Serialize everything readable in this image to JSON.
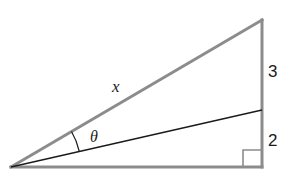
{
  "diagram": {
    "type": "right-triangle",
    "labels": {
      "hypotenuse": "x",
      "angle": "θ",
      "upper_segment": "3",
      "lower_segment": "2"
    },
    "vertices": {
      "left": [
        11,
        167
      ],
      "top_right": [
        262,
        20
      ],
      "bottom_right": [
        262,
        167
      ],
      "split_point": [
        262,
        110
      ]
    },
    "right_angle_marker": {
      "x": 243,
      "y": 150,
      "size": 17
    },
    "colors": {
      "triangle_edges": "#8c8c8c",
      "inner_line": "#1a1a1a",
      "text": "#1a1a1a",
      "background": "#ffffff"
    }
  }
}
